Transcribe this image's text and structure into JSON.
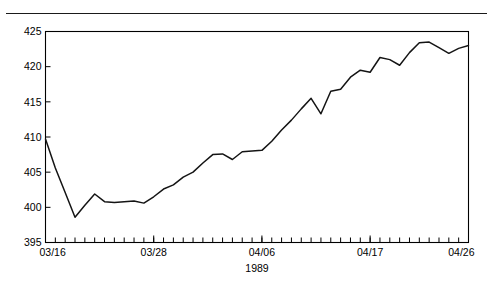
{
  "figure": {
    "top_rule": "horizontal-rule",
    "faded_title": ""
  },
  "chart_data": {
    "type": "line",
    "title": "",
    "subtitle": "",
    "xlabel": "1989",
    "ylabel": "",
    "ylim": [
      395,
      425
    ],
    "y_ticks": [
      395,
      400,
      405,
      410,
      415,
      420,
      425
    ],
    "y_tick_labels": [
      "395",
      "400",
      "405",
      "410",
      "415",
      "420",
      "425"
    ],
    "x_tick_labels": [
      "03/16",
      "03/28",
      "04/06",
      "04/17",
      "04/26"
    ],
    "x_tick_label_positions": [
      0,
      11,
      22,
      33,
      43
    ],
    "x_minor_tick_count": 44,
    "xlim": [
      0,
      43
    ],
    "grid": false,
    "legend": null,
    "series": [
      {
        "name": "index",
        "x": [
          0,
          1,
          2,
          3,
          4,
          5,
          6,
          7,
          8,
          9,
          10,
          11,
          12,
          13,
          14,
          15,
          16,
          17,
          18,
          19,
          20,
          21,
          22,
          23,
          24,
          25,
          26,
          27,
          28,
          29,
          30,
          31,
          32,
          33,
          34,
          35,
          36,
          37,
          38,
          39,
          40,
          41,
          42,
          43
        ],
        "values": [
          409.7,
          405.6,
          402.1,
          398.6,
          400.3,
          401.9,
          400.8,
          400.7,
          400.8,
          400.9,
          400.6,
          401.5,
          402.6,
          403.2,
          404.3,
          405.0,
          406.3,
          407.5,
          407.6,
          406.8,
          407.9,
          408.0,
          408.1,
          409.4,
          411.0,
          412.4,
          414.0,
          415.5,
          413.3,
          416.5,
          416.8,
          418.5,
          419.5,
          419.2,
          421.3,
          421.0,
          420.2,
          422.0,
          423.4,
          423.5,
          422.7,
          421.9,
          422.6,
          423.0
        ]
      }
    ]
  }
}
